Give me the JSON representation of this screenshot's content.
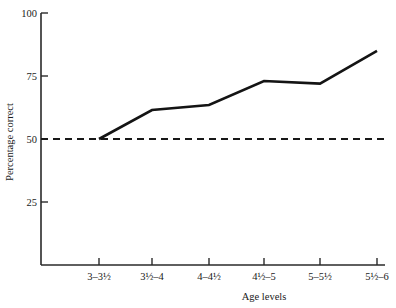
{
  "chart_data": {
    "type": "line",
    "title": "",
    "xlabel": "Age levels",
    "ylabel": "Percentage correct",
    "categories": [
      "3–3½",
      "3½–4",
      "4–4½",
      "4½–5",
      "5–5½",
      "5½–6"
    ],
    "values": [
      50,
      61.5,
      63.5,
      73,
      72,
      85
    ],
    "series": [
      {
        "name": "Percentage correct",
        "values": [
          50,
          61.5,
          63.5,
          73,
          72,
          85
        ]
      }
    ],
    "ylim": [
      0,
      100
    ],
    "yticks": [
      25,
      50,
      75,
      100
    ],
    "ytick_labels": [
      "25",
      "50",
      "75",
      "100"
    ],
    "grid": false,
    "legend": "none",
    "reference_lines": [
      {
        "name": "chance-level",
        "axis": "y",
        "value": 50,
        "style": "dashed",
        "label": ""
      }
    ],
    "line_color": "#141414",
    "reference_line_color": "#181818",
    "axis_color": "#2a2a2a",
    "background_color": "#ffffff"
  },
  "axes": {
    "y_title": "Percentage correct",
    "x_title": "Age levels",
    "y_labels": [
      "100",
      "75",
      "50",
      "25"
    ],
    "x_labels": [
      "3–3½",
      "3½–4",
      "4–4½",
      "4½–5",
      "5–5½",
      "5½–6"
    ]
  }
}
